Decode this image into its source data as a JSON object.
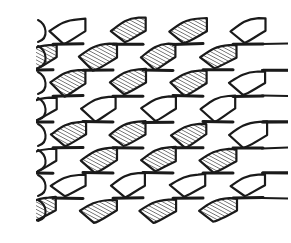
{
  "figure": {
    "type": "line-drawing",
    "width": 291,
    "height": 243,
    "background_color": "#ffffff",
    "stroke_color": "#1a1a1a",
    "hatch_color": "#1a1a1a",
    "hatch_angle_deg": 62,
    "hatch_spacing_px": 3.2,
    "geometry": {
      "left_margin": 38,
      "right_margin": 283,
      "node_rows_y": [
        18,
        44,
        70,
        96,
        122,
        148,
        173,
        198,
        223
      ],
      "column_node_x": [
        38,
        98,
        158,
        218,
        278
      ],
      "stagger_offset_x": 30,
      "node_half_width": 12,
      "cell_half_height": 13,
      "band_count": 8,
      "cells_per_band": 4
    },
    "hatched_bands": [
      {
        "band": 0,
        "hatched_cells": [
          0,
          2,
          3
        ]
      },
      {
        "band": 1,
        "hatched_cells": [
          0,
          1,
          2,
          3
        ]
      },
      {
        "band": 2,
        "hatched_cells": [
          0,
          1,
          2,
          3
        ]
      },
      {
        "band": 3,
        "hatched_cells": []
      },
      {
        "band": 4,
        "hatched_cells": [
          0,
          1,
          2,
          3
        ]
      },
      {
        "band": 5,
        "hatched_cells": [
          1,
          2,
          3
        ]
      },
      {
        "band": 6,
        "hatched_cells": []
      },
      {
        "band": 7,
        "hatched_cells": [
          0,
          1,
          2,
          3
        ]
      }
    ],
    "edge_notes": {
      "left": "Cells clipped at left border, open strand stubs visible",
      "right": "Cells clipped at right border, short horizontal strand stubs project past node",
      "top": "Topmost band open (unhatched) with partial upper arcs",
      "bottom": "Bottom band partially cropped"
    }
  }
}
